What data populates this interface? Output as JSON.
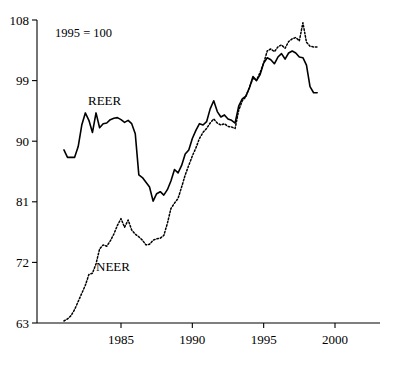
{
  "note": "1995 = 100",
  "labels": {
    "reer": "REER",
    "neer": "NEER"
  },
  "axes": {
    "y_ticks": [
      "63",
      "72",
      "81",
      "90",
      "99",
      "108"
    ],
    "x_ticks": [
      "1985",
      "1990",
      "1995",
      "2000"
    ]
  },
  "chart_data": {
    "type": "line",
    "title": "",
    "subtitle": "1995 = 100",
    "xlabel": "",
    "ylabel": "",
    "xlim": [
      1980.9,
      1999.8
    ],
    "ylim": [
      63,
      108
    ],
    "yticks": [
      63,
      72,
      81,
      90,
      99,
      108
    ],
    "xticks": [
      1985,
      1990,
      1995,
      2000
    ],
    "grid": false,
    "legend": "inline-annotation",
    "annotations": [
      {
        "text": "1995 = 100",
        "x": 1982.3,
        "y": 106.0
      },
      {
        "text": "REER",
        "x": 1984.2,
        "y": 96.5
      },
      {
        "text": "NEER",
        "x": 1985.6,
        "y": 71.5
      }
    ],
    "series": [
      {
        "name": "REER",
        "style": "solid",
        "x": [
          1981.0,
          1981.25,
          1981.5,
          1981.75,
          1982.0,
          1982.25,
          1982.5,
          1982.75,
          1983.0,
          1983.25,
          1983.5,
          1983.75,
          1984.0,
          1984.25,
          1984.5,
          1984.75,
          1985.0,
          1985.25,
          1985.5,
          1985.75,
          1986.0,
          1986.25,
          1986.5,
          1986.75,
          1987.0,
          1987.25,
          1987.5,
          1987.75,
          1988.0,
          1988.25,
          1988.5,
          1988.75,
          1989.0,
          1989.25,
          1989.5,
          1989.75,
          1990.0,
          1990.25,
          1990.5,
          1990.75,
          1991.0,
          1991.25,
          1991.5,
          1991.75,
          1992.0,
          1992.25,
          1992.5,
          1992.75,
          1993.0,
          1993.25,
          1993.5,
          1993.75,
          1994.0,
          1994.25,
          1994.5,
          1994.75,
          1995.0,
          1995.25,
          1995.5,
          1995.75,
          1996.0,
          1996.25,
          1996.5,
          1996.75,
          1997.0,
          1997.25,
          1997.5,
          1997.75,
          1998.0,
          1998.25,
          1998.5,
          1998.75
        ],
        "y": [
          88.7,
          87.6,
          87.6,
          87.6,
          89.2,
          92.4,
          94.2,
          93.1,
          91.3,
          94.2,
          92.0,
          92.6,
          92.7,
          93.2,
          93.4,
          93.5,
          93.2,
          92.8,
          93.1,
          92.6,
          91.1,
          85.0,
          84.6,
          83.9,
          83.2,
          81.1,
          82.2,
          82.5,
          82.0,
          82.8,
          84.1,
          85.8,
          85.3,
          86.4,
          88.1,
          88.7,
          90.4,
          91.6,
          92.6,
          92.4,
          92.9,
          94.8,
          96.0,
          94.4,
          93.6,
          93.9,
          93.3,
          93.1,
          92.7,
          95.2,
          96.3,
          96.7,
          97.9,
          99.6,
          99.0,
          99.9,
          101.6,
          102.4,
          102.1,
          101.5,
          102.5,
          103.0,
          102.2,
          103.1,
          103.4,
          103.1,
          102.5,
          102.4,
          101.3,
          98.1,
          97.2,
          97.2
        ]
      },
      {
        "name": "NEER",
        "style": "dotted",
        "x": [
          1981.0,
          1981.25,
          1981.5,
          1981.75,
          1982.0,
          1982.25,
          1982.5,
          1982.75,
          1983.0,
          1983.25,
          1983.5,
          1983.75,
          1984.0,
          1984.25,
          1984.5,
          1984.75,
          1985.0,
          1985.25,
          1985.5,
          1985.75,
          1986.0,
          1986.25,
          1986.5,
          1986.75,
          1987.0,
          1987.25,
          1987.5,
          1987.75,
          1988.0,
          1988.25,
          1988.5,
          1988.75,
          1989.0,
          1989.25,
          1989.5,
          1989.75,
          1990.0,
          1990.25,
          1990.5,
          1990.75,
          1991.0,
          1991.25,
          1991.5,
          1991.75,
          1992.0,
          1992.25,
          1992.5,
          1992.75,
          1993.0,
          1993.25,
          1993.5,
          1993.75,
          1994.0,
          1994.25,
          1994.5,
          1994.75,
          1995.0,
          1995.25,
          1995.5,
          1995.75,
          1996.0,
          1996.25,
          1996.5,
          1996.75,
          1997.0,
          1997.25,
          1997.5,
          1997.75,
          1998.0,
          1998.25,
          1998.5,
          1998.75
        ],
        "y": [
          63.3,
          63.6,
          64.1,
          65.0,
          66.2,
          67.4,
          68.6,
          70.2,
          70.4,
          71.8,
          74.0,
          74.6,
          74.4,
          75.2,
          76.2,
          77.5,
          78.5,
          77.2,
          78.3,
          76.8,
          76.2,
          75.8,
          75.3,
          74.6,
          74.7,
          75.3,
          75.5,
          75.6,
          76.0,
          77.8,
          80.0,
          80.8,
          81.5,
          83.2,
          85.0,
          86.4,
          87.8,
          89.0,
          90.4,
          91.3,
          91.9,
          92.7,
          93.3,
          92.7,
          92.4,
          92.6,
          92.2,
          92.1,
          91.9,
          94.6,
          96.0,
          96.6,
          98.0,
          99.3,
          99.1,
          100.2,
          101.6,
          103.4,
          103.7,
          103.3,
          104.0,
          104.3,
          103.8,
          104.8,
          105.2,
          105.4,
          104.9,
          107.6,
          104.7,
          104.1,
          104.0,
          104.0
        ]
      }
    ]
  }
}
